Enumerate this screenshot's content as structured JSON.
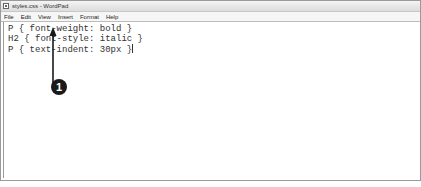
{
  "window": {
    "title": "styles.css - WordPad"
  },
  "menu": {
    "items": [
      {
        "label": "File",
        "hotkey": "F"
      },
      {
        "label": "Edit",
        "hotkey": "E"
      },
      {
        "label": "View",
        "hotkey": "V"
      },
      {
        "label": "Insert",
        "hotkey": "I"
      },
      {
        "label": "Format",
        "hotkey": "o"
      },
      {
        "label": "Help",
        "hotkey": "H"
      }
    ]
  },
  "editor": {
    "lines": [
      "P { font-weight: bold }",
      "H2 { font-style: italic }",
      "P { text-indent: 30px }"
    ]
  },
  "callout": {
    "number": "1",
    "color": "#1a1a1a"
  }
}
